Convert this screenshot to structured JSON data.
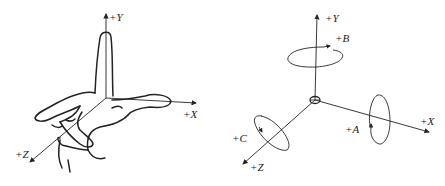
{
  "left_figure": {
    "description": "right-hand rule",
    "labels": {
      "y": "+Y",
      "x": "+X",
      "z": "+Z"
    }
  },
  "right_figure": {
    "description": "coordinate axes with rotation directions",
    "labels": {
      "y": "+Y",
      "x": "+X",
      "z": "+Z",
      "a": "+A",
      "b": "+B",
      "c": "+C"
    }
  }
}
